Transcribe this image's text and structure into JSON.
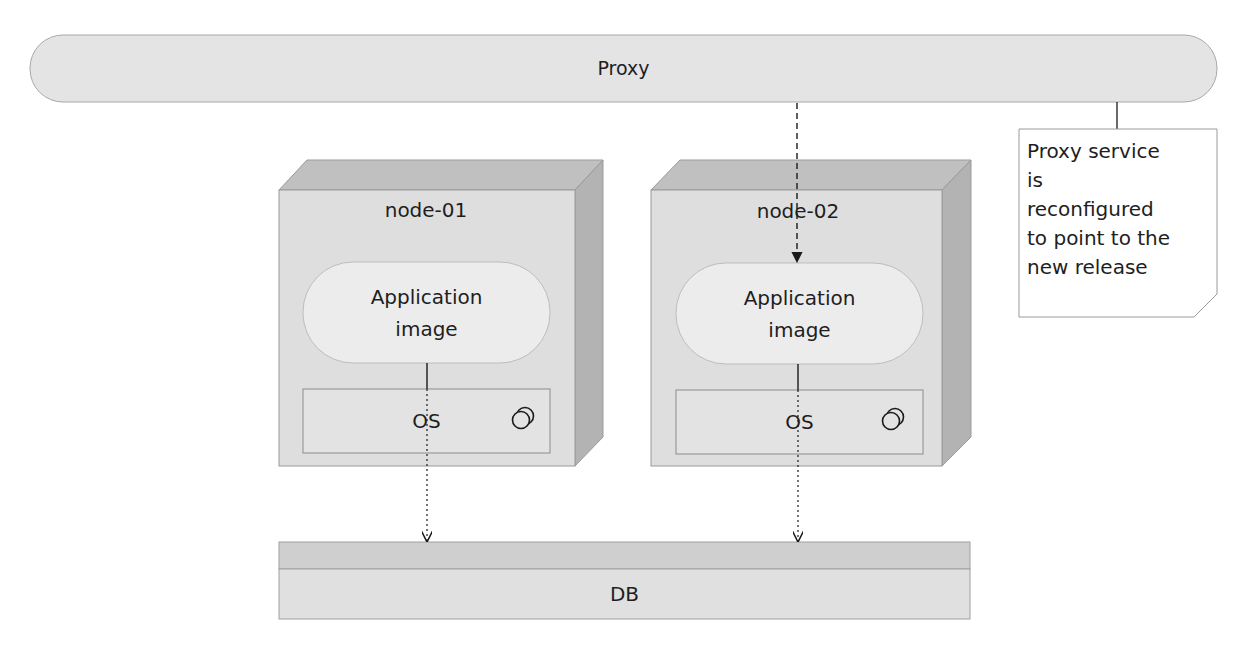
{
  "proxy": {
    "label": "Proxy"
  },
  "nodes": [
    {
      "title": "node-01",
      "app": {
        "line1": "Application",
        "line2": "image"
      },
      "os": {
        "label": "OS",
        "icon": "component-icon"
      }
    },
    {
      "title": "node-02",
      "app": {
        "line1": "Application",
        "line2": "image"
      },
      "os": {
        "label": "OS",
        "icon": "component-icon"
      }
    }
  ],
  "db": {
    "label": "DB"
  },
  "note": {
    "lines": [
      "Proxy service",
      "is",
      "reconfigured",
      "to point to the",
      "new release"
    ]
  },
  "colors": {
    "shape_fill": "#e6e6e6",
    "node_front": "#dddddd",
    "node_top": "#bdbdbd",
    "node_side": "#b5b5b5",
    "inner_fill": "#ebebeb",
    "stroke": "#8c8c8c",
    "line": "#1a1a1a"
  }
}
